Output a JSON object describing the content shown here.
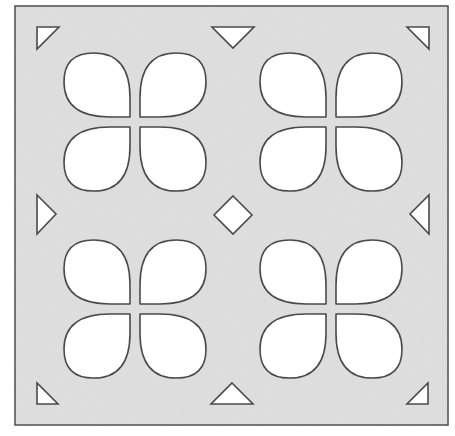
{
  "figure": {
    "colors": {
      "page_background": "#ffffff",
      "plate_fill": "#dadada",
      "outline": "#4a4a4a",
      "cutout_fill": "#ffffff"
    },
    "plate": {
      "x": 15,
      "y": 6,
      "width": 433,
      "height": 419
    },
    "petal_groups": [
      {
        "name": "top-left-group",
        "cx": 135,
        "cy": 122
      },
      {
        "name": "top-right-group",
        "cx": 331,
        "cy": 122
      },
      {
        "name": "bottom-left-group",
        "cx": 135,
        "cy": 309
      },
      {
        "name": "bottom-right-group",
        "cx": 331,
        "cy": 309
      }
    ],
    "petal": {
      "gap": 10,
      "width": 66,
      "height": 64,
      "corner_radius": 40
    },
    "triangles": [
      {
        "name": "corner-top-left",
        "points": "37,27 59,27 37,49"
      },
      {
        "name": "edge-top-center",
        "points": "212,27 254,27 233,48"
      },
      {
        "name": "corner-top-right",
        "points": "407,27 429,27 429,49"
      },
      {
        "name": "edge-left-middle",
        "points": "37,195 56,214 37,234"
      },
      {
        "name": "edge-right-middle",
        "points": "429,195 429,234 410,214"
      },
      {
        "name": "corner-bottom-left",
        "points": "37,383 37,404 58,404"
      },
      {
        "name": "edge-bottom-center",
        "points": "232,383 253,404 211,404"
      },
      {
        "name": "corner-bottom-right",
        "points": "428,383 428,404 407,404"
      }
    ],
    "diamond": {
      "name": "center-diamond",
      "cx": 233,
      "cy": 215,
      "r": 19
    }
  }
}
